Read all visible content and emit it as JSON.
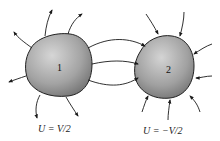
{
  "diagram": {
    "type": "electrostatics-two-conductors",
    "conductors": [
      {
        "id": "1",
        "label": "1",
        "potential_label": "U = V/2",
        "field_direction": "outward"
      },
      {
        "id": "2",
        "label": "2",
        "potential_label": "U = −V/2",
        "field_direction": "inward"
      }
    ],
    "connecting_field_lines": 3,
    "colors": {
      "body_light": "#c8c8c8",
      "body_dark": "#7a7a7a",
      "line": "#1a1a1a"
    }
  }
}
